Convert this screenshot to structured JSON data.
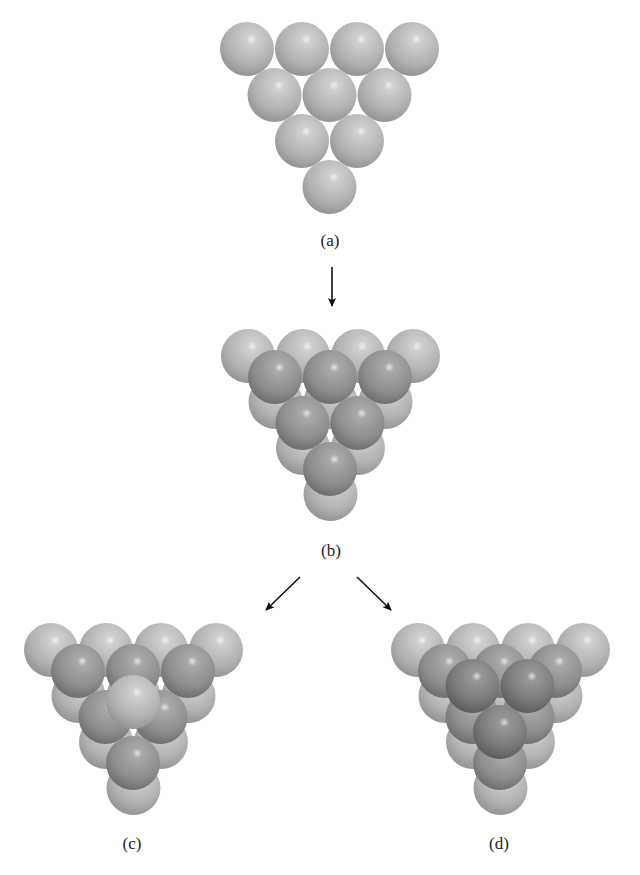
{
  "figure": {
    "labels": [
      {
        "id": "a",
        "text": "(a)",
        "x": 330,
        "y": 231
      },
      {
        "id": "b",
        "text": "(b)",
        "x": 331,
        "y": 541
      },
      {
        "id": "c",
        "text": "(c)",
        "x": 132,
        "y": 834
      },
      {
        "id": "d",
        "text": "(d)",
        "x": 499,
        "y": 834
      }
    ],
    "sphere_radius": 27,
    "spacing_x": 55,
    "spacing_y": 46,
    "colors": {
      "light_sphere": "#b4b4b4",
      "medium_sphere": "#8f8f8f",
      "dark_sphere": "#7a7a7a",
      "highlight": "#f2f2f2",
      "arrow": "#111111"
    },
    "panels": [
      {
        "id": "a",
        "description": "Single close-packed triangular layer of 10 spheres",
        "layers": [
          {
            "name": "layer-1",
            "origin": [
              247,
              49
            ],
            "rows": 4,
            "shade": "light"
          }
        ]
      },
      {
        "id": "b",
        "description": "Second layer of 6 spheres placed in hollows of first layer",
        "layers": [
          {
            "name": "layer-1",
            "origin": [
              248,
              356
            ],
            "rows": 4,
            "shade": "light"
          },
          {
            "name": "layer-2",
            "origin": [
              275,
              377
            ],
            "rows": 3,
            "shade": "medium"
          }
        ]
      },
      {
        "id": "c",
        "description": "Third layer sphere directly above first-layer sphere (ABA)",
        "layers": [
          {
            "name": "layer-1",
            "origin": [
              51,
              650
            ],
            "rows": 4,
            "shade": "light"
          },
          {
            "name": "layer-2",
            "origin": [
              78,
              671
            ],
            "rows": 3,
            "shade": "medium"
          },
          {
            "name": "layer-3",
            "origin": [
              133,
              702
            ],
            "rows": 1,
            "shade": "light"
          }
        ]
      },
      {
        "id": "d",
        "description": "Third layer spheres over holes of first layer (ABC)",
        "layers": [
          {
            "name": "layer-1",
            "origin": [
              418,
              650
            ],
            "rows": 4,
            "shade": "light"
          },
          {
            "name": "layer-2",
            "origin": [
              445,
              671
            ],
            "rows": 3,
            "shade": "medium"
          },
          {
            "name": "layer-3",
            "origin": [
              472.5,
              686
            ],
            "rows": 2,
            "shade": "dark"
          }
        ]
      }
    ],
    "arrows": [
      {
        "name": "arrow-a-to-b",
        "from": [
          332,
          267
        ],
        "to": [
          332,
          306
        ]
      },
      {
        "name": "arrow-b-to-c",
        "from": [
          300,
          577
        ],
        "to": [
          266,
          610
        ]
      },
      {
        "name": "arrow-b-to-d",
        "from": [
          357,
          577
        ],
        "to": [
          391,
          610
        ]
      }
    ]
  }
}
